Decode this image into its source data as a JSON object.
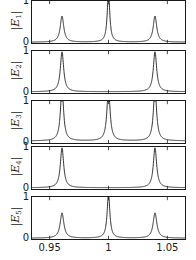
{
  "figure": {
    "type": "multi-panel-line-plot",
    "panel_count": 5,
    "width": 196,
    "height": 260,
    "background": "#ffffff",
    "line_color": "#1a1a1a"
  },
  "axis": {
    "x": {
      "min": 0.935,
      "max": 1.065,
      "ticks": [
        0.95,
        1,
        1.05
      ],
      "tick_labels": [
        "0.95",
        "1",
        "1.05"
      ],
      "label": ""
    },
    "y": {
      "min": 0,
      "max": 1,
      "ticks": [
        0,
        1
      ],
      "tick_labels": [
        "0",
        "1"
      ],
      "label": ""
    }
  },
  "panels": [
    {
      "ylabel_prefix": "|E",
      "ylabel_index": "1",
      "ylabel_suffix": "|",
      "ylabel_text": "|E1|",
      "ytick_top": "1",
      "ytick_bottom": "0"
    },
    {
      "ylabel_prefix": "|E",
      "ylabel_index": "2",
      "ylabel_suffix": "|",
      "ylabel_text": "|E2|",
      "ytick_top": "1",
      "ytick_bottom": "0"
    },
    {
      "ylabel_prefix": "|E",
      "ylabel_index": "3",
      "ylabel_suffix": "|",
      "ylabel_text": "|E3|",
      "ytick_top": "1",
      "ytick_bottom": "0"
    },
    {
      "ylabel_prefix": "|E",
      "ylabel_index": "4",
      "ylabel_suffix": "|",
      "ylabel_text": "|E4|",
      "ytick_top": "1",
      "ytick_bottom": "0"
    },
    {
      "ylabel_prefix": "|E",
      "ylabel_index": "5",
      "ylabel_suffix": "|",
      "ylabel_text": "|E5|",
      "ytick_top": "1",
      "ytick_bottom": "0"
    }
  ],
  "chart_data": {
    "type": "line",
    "title": "",
    "xlabel": "",
    "ylabel": "",
    "xlim": [
      0.935,
      1.065
    ],
    "ylim": [
      0,
      1
    ],
    "grid": false,
    "legend": "none",
    "xticks": [
      0.95,
      1,
      1.05
    ],
    "xtick_labels": [
      "0.95",
      "1",
      "1.05"
    ],
    "yticks": [
      0,
      1
    ],
    "ytick_labels": [
      "0",
      "1"
    ],
    "series": [
      {
        "name": "|E1|",
        "panel": 1,
        "lineshape": "lorentzian-sum",
        "peaks": [
          {
            "center": 0.9605,
            "amplitude": 0.62,
            "hwhm": 0.0018
          },
          {
            "center": 1.0,
            "amplitude": 1.18,
            "hwhm": 0.0013
          },
          {
            "center": 1.0395,
            "amplitude": 0.62,
            "hwhm": 0.0018
          }
        ],
        "baseline": 0.02
      },
      {
        "name": "|E2|",
        "panel": 2,
        "lineshape": "lorentzian-sum",
        "peaks": [
          {
            "center": 0.9605,
            "amplitude": 0.95,
            "hwhm": 0.0017
          },
          {
            "center": 1.0395,
            "amplitude": 0.95,
            "hwhm": 0.0017
          }
        ],
        "baseline": 0.03
      },
      {
        "name": "|E3|",
        "panel": 3,
        "lineshape": "lorentzian-sum",
        "peaks": [
          {
            "center": 0.9605,
            "amplitude": 1.25,
            "hwhm": 0.0016
          },
          {
            "center": 1.0,
            "amplitude": 1.25,
            "hwhm": 0.0016
          },
          {
            "center": 1.0395,
            "amplitude": 1.25,
            "hwhm": 0.0016
          }
        ],
        "baseline": 0.05
      },
      {
        "name": "|E4|",
        "panel": 4,
        "lineshape": "lorentzian-sum",
        "peaks": [
          {
            "center": 0.9605,
            "amplitude": 0.95,
            "hwhm": 0.0017
          },
          {
            "center": 1.0395,
            "amplitude": 0.95,
            "hwhm": 0.0017
          }
        ],
        "baseline": 0.03
      },
      {
        "name": "|E5|",
        "panel": 5,
        "lineshape": "lorentzian-sum",
        "peaks": [
          {
            "center": 0.9605,
            "amplitude": 0.6,
            "hwhm": 0.0019
          },
          {
            "center": 1.0,
            "amplitude": 1.05,
            "hwhm": 0.0014
          },
          {
            "center": 1.0395,
            "amplitude": 0.6,
            "hwhm": 0.0019
          }
        ],
        "baseline": 0.02
      }
    ]
  },
  "layout": {
    "panel_tops": [
      0,
      50,
      100,
      146,
      196
    ],
    "panel_heights": [
      44,
      44,
      44,
      44,
      44
    ],
    "plot_left": 31,
    "plot_width": 155
  }
}
